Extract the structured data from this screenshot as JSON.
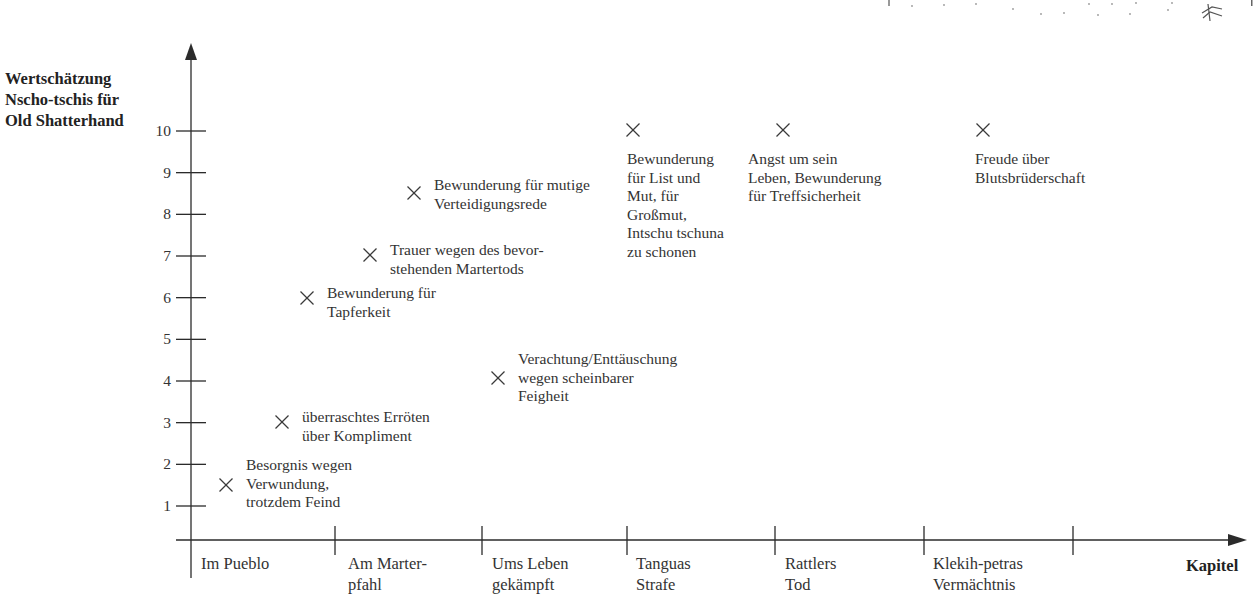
{
  "chart_data": {
    "type": "scatter",
    "title": "",
    "ylabel": "Wertschätzung\nNscho-tschis für\nOld Shatterhand",
    "xlabel": "Kapitel",
    "ylim": [
      0,
      10
    ],
    "yticks": [
      1,
      2,
      3,
      4,
      5,
      6,
      7,
      8,
      9,
      10
    ],
    "grid": false,
    "marker": "x",
    "categories": [
      "Im Pueblo",
      "Am Marter-\npfahl",
      "Ums Leben\ngekämpft",
      "Tanguas\nStrafe",
      "Rattlers\nTod",
      "Klekih-petras\nVermächtnis"
    ],
    "points": [
      {
        "chapter": "Im Pueblo",
        "x": 0.3,
        "y": 1.5,
        "label": "Besorgnis wegen\nVerwundung,\ntrotzdem Feind"
      },
      {
        "chapter": "Im Pueblo",
        "x": 0.65,
        "y": 3,
        "label": "überraschtes Erröten\nüber Kompliment"
      },
      {
        "chapter": "Im Pueblo",
        "x": 0.8,
        "y": 6,
        "label": "Bewunderung für\nTapferkeit"
      },
      {
        "chapter": "Am Marter-\npfahl",
        "x": 1.25,
        "y": 7,
        "label": "Trauer wegen des bevor-\nstehenden Martertods"
      },
      {
        "chapter": "Am Marter-\npfahl",
        "x": 1.55,
        "y": 8.5,
        "label": "Bewunderung für mutige\nVerteidigungsrede"
      },
      {
        "chapter": "Ums Leben\ngekämpft",
        "x": 2.1,
        "y": 4,
        "label": "Verachtung/Enttäuschung\nwegen scheinbarer\nFeigheit"
      },
      {
        "chapter": "Tanguas\nStrafe",
        "x": 3.05,
        "y": 10,
        "label": "Bewunderung\nfür List und\nMut, für\nGroßmut,\nIntschu tschuna\nzu schonen"
      },
      {
        "chapter": "Rattlers\nTod",
        "x": 4.05,
        "y": 10,
        "label": "Angst um sein\nLeben, Bewunderung\nfür Treffsicherheit"
      },
      {
        "chapter": "Klekih-petras\nVermächtnis",
        "x": 5.4,
        "y": 10,
        "label": "Freude über\nBlutsbrüderschaft"
      }
    ]
  },
  "colors": {
    "axis": "#2b2b2b",
    "marker": "#3a3a3a",
    "text": "#333333",
    "background": "#ffffff"
  }
}
